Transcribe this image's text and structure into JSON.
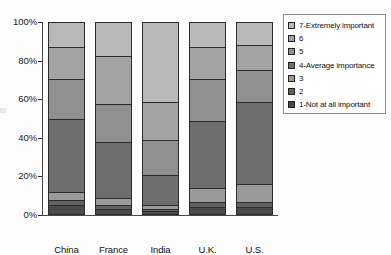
{
  "chart_data": {
    "type": "bar",
    "subtype": "stacked-100-percent",
    "title": "",
    "xlabel": "",
    "ylabel": "",
    "ylim": [
      0,
      100
    ],
    "y_tick_labels": [
      "0%",
      "20%",
      "40%",
      "60%",
      "80%",
      "100%"
    ],
    "y_ticks": [
      0,
      20,
      40,
      60,
      80,
      100
    ],
    "grid": false,
    "legend_position": "right",
    "categories": [
      "China",
      "France",
      "India",
      "U.K.",
      "U.S."
    ],
    "series": [
      {
        "name": "7-Extremely important",
        "color": "#b9b9b9",
        "values": [
          13,
          18,
          42,
          13,
          12
        ]
      },
      {
        "name": "6",
        "color": "#a3a3a3",
        "values": [
          17,
          25,
          20,
          17,
          13
        ]
      },
      {
        "name": "5",
        "color": "#909090",
        "values": [
          21,
          20,
          18,
          22,
          17
        ]
      },
      {
        "name": "4-Average importance",
        "color": "#6e6e6e",
        "values": [
          38,
          29,
          16,
          35,
          43
        ]
      },
      {
        "name": "3",
        "color": "#9a9a9a",
        "values": [
          4,
          4,
          2,
          7,
          9
        ]
      },
      {
        "name": "2",
        "color": "#616161",
        "values": [
          3,
          2,
          1,
          3,
          3
        ]
      },
      {
        "name": "1-Not at all important",
        "color": "#4a4a4a",
        "values": [
          4,
          2,
          1,
          3,
          3
        ]
      }
    ]
  },
  "legend": {
    "items": [
      {
        "label": "7-Extremely important",
        "color": "#b9b9b9"
      },
      {
        "label": "6",
        "color": "#a3a3a3"
      },
      {
        "label": "5",
        "color": "#909090"
      },
      {
        "label": "4-Average importance",
        "color": "#6e6e6e"
      },
      {
        "label": "3",
        "color": "#9a9a9a"
      },
      {
        "label": "2",
        "color": "#616161"
      },
      {
        "label": "1-Not at all important",
        "color": "#4a4a4a"
      }
    ]
  }
}
